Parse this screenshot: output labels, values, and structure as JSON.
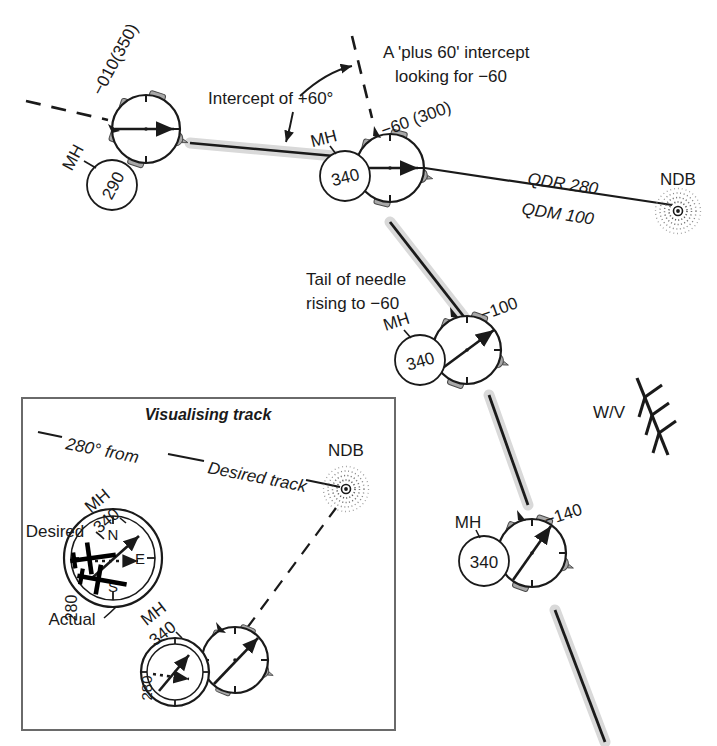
{
  "figure": {
    "kind": "aviation-navigation-diagram",
    "topic": "NDB intercept of a QDR using a plus-60 intercept"
  },
  "colors": {
    "ink": "#1a1a1a",
    "aircraft_fill": "#a8a8a8",
    "aircraft_fill_light": "#bdbdbd",
    "instrument_fill": "#ffffff",
    "track_shadow": "#d9d9d9",
    "box_border": "#555555",
    "background": "#ffffff"
  },
  "annotations": {
    "intercept_callout": "Intercept of +60°",
    "plus60_line1": "A 'plus 60' intercept",
    "plus60_line2": "looking for −60",
    "tail_line1": "Tail of needle",
    "tail_line2": "rising to −60",
    "qdr": "QDR 280",
    "qdm": "QDM 100",
    "ndb": "NDB",
    "wind": "W/V"
  },
  "aircraft": [
    {
      "id": "ac-1",
      "mh_prefix": "MH",
      "mh_value": "290",
      "relative_bearing": "−010(350)",
      "needle_deg": 90
    },
    {
      "id": "ac-2",
      "mh_prefix": "MH",
      "mh_value": "340",
      "relative_bearing": "−60 (300)",
      "needle_deg": 90
    },
    {
      "id": "ac-3",
      "mh_prefix": "MH",
      "mh_value": "340",
      "relative_bearing": "−100",
      "needle_deg": 55
    },
    {
      "id": "ac-4",
      "mh_prefix": "MH",
      "mh_value": "340",
      "relative_bearing": "−140",
      "needle_deg": 28
    }
  ],
  "inset": {
    "title": "Visualising track",
    "from_label": "280° from",
    "desired_track_label": "Desired track",
    "ndb": "NDB",
    "compass": {
      "mh_prefix": "MH",
      "mh_value": "340",
      "track_value": "280",
      "desired_label": "Desired",
      "actual_label": "Actual",
      "cardinal_n": "N",
      "cardinal_s": "S",
      "cardinal_e": "E"
    },
    "aircraft": {
      "mh_prefix": "MH",
      "mh_value": "340",
      "track_value": "280"
    }
  }
}
